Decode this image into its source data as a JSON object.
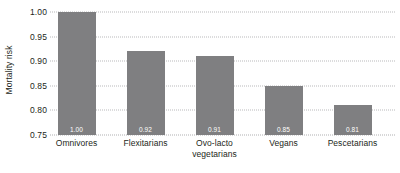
{
  "chart_data": {
    "type": "bar",
    "title": "",
    "xlabel": "",
    "ylabel": "Mortality risk",
    "categories": [
      "Omnivores",
      "Flexitarians",
      "Ovo-lacto vegetarians",
      "Vegans",
      "Pescetarians"
    ],
    "category_lines": [
      [
        "Omnivores"
      ],
      [
        "Flexitarians"
      ],
      [
        "Ovo-lacto",
        "vegetarians"
      ],
      [
        "Vegans"
      ],
      [
        "Pescetarians"
      ]
    ],
    "values": [
      1.0,
      0.92,
      0.91,
      0.85,
      0.81
    ],
    "value_labels": [
      "1.00",
      "0.92",
      "0.91",
      "0.85",
      "0.81"
    ],
    "ylim": [
      0.75,
      1.0
    ],
    "yticks": [
      0.75,
      0.8,
      0.85,
      0.9,
      0.95,
      1.0
    ],
    "ytick_labels": [
      "0.75",
      "0.80",
      "0.85",
      "0.90",
      "0.95",
      "1.00"
    ],
    "grid": true,
    "grid_style": "dotted",
    "legend": false,
    "bar_color": "#7f7f81",
    "value_label_color": "#ffffff",
    "grid_color": "#b9b9bb",
    "text_color": "#231f20",
    "background": "#ffffff"
  }
}
